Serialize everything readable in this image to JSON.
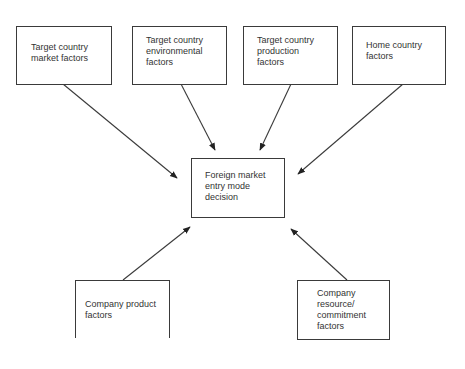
{
  "diagram": {
    "center": {
      "label": "Foreign market\nentry mode\ndecision"
    },
    "top_factors": [
      {
        "label": "Target country\nmarket factors"
      },
      {
        "label": "Target country\nenvironmental\nfactors"
      },
      {
        "label": "Target country\nproduction\nfactors"
      },
      {
        "label": "Home country\nfactors"
      }
    ],
    "bottom_factors": [
      {
        "label": "Company product\nfactors"
      },
      {
        "label": "Company\nresource/\ncommitment\nfactors"
      }
    ],
    "colors": {
      "line": "#3a3a3a",
      "text": "#333333",
      "background": "#ffffff"
    }
  }
}
